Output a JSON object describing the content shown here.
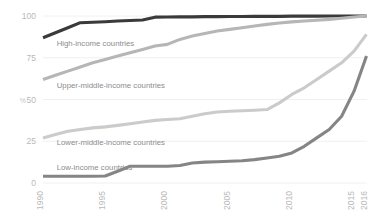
{
  "chart_data": {
    "type": "line",
    "title": "",
    "subtitle": "",
    "xlabel": "",
    "ylabel": "%",
    "ylim": [
      0,
      100
    ],
    "xlim": [
      1990,
      2016
    ],
    "grid": true,
    "legend_position": "inline-labels",
    "yticks": [
      0,
      25,
      50,
      75,
      100
    ],
    "ytick_labels": [
      "0",
      "25",
      "50",
      "75",
      "100"
    ],
    "xticks": [
      1990,
      1995,
      2000,
      2005,
      2010,
      2015,
      2016
    ],
    "xtick_labels": [
      "1990",
      "1995",
      "2000",
      "2005",
      "2010",
      "2015",
      "2016"
    ],
    "x": [
      1990,
      1991,
      1992,
      1993,
      1994,
      1995,
      1996,
      1997,
      1998,
      1999,
      2000,
      2001,
      2002,
      2003,
      2004,
      2005,
      2006,
      2007,
      2008,
      2009,
      2010,
      2011,
      2012,
      2013,
      2014,
      2015,
      2016
    ],
    "series": [
      {
        "name": "High-income countries",
        "color": "#3a3a3a",
        "label_x": 1991.1,
        "label_y": 82,
        "values": [
          87,
          90,
          93,
          96,
          96.3,
          96.6,
          97,
          97.3,
          97.6,
          99.3,
          99.4,
          99.5,
          99.5,
          99.6,
          99.6,
          99.7,
          99.7,
          99.8,
          99.8,
          99.8,
          99.9,
          99.9,
          99.9,
          100,
          100,
          100,
          100
        ]
      },
      {
        "name": "Upper-middle-income countries",
        "color": "#b6b6b6",
        "label_x": 1991.1,
        "label_y": 57,
        "values": [
          62,
          64.5,
          67,
          69.5,
          72,
          74,
          76,
          78,
          80,
          82,
          83,
          86,
          88,
          89.5,
          91,
          92,
          93,
          94,
          95,
          95.8,
          96.5,
          97,
          97.5,
          98,
          98.7,
          99.4,
          100
        ]
      },
      {
        "name": "Lower-middle-income countries",
        "color": "#cbcbcb",
        "label_x": 1991.1,
        "label_y": 23,
        "values": [
          27,
          29,
          31,
          32,
          33,
          33.6,
          34.5,
          35.5,
          36.5,
          37.5,
          38,
          38.5,
          40,
          41.5,
          42.5,
          43,
          43.3,
          43.6,
          44,
          48,
          53,
          57,
          62,
          67,
          72,
          79,
          89
        ]
      },
      {
        "name": "Low-income countries",
        "color": "#858585",
        "label_x": 1991.1,
        "label_y": 7.5,
        "values": [
          4,
          4,
          4,
          4,
          4,
          4.2,
          7,
          10,
          10,
          10,
          10,
          10.5,
          12,
          12.5,
          12.7,
          13,
          13.3,
          14,
          15,
          16,
          18,
          22,
          27,
          32,
          40,
          55,
          76
        ]
      }
    ]
  }
}
